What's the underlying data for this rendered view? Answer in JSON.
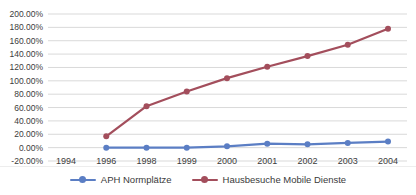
{
  "chart_data": {
    "type": "line",
    "categories": [
      "1994",
      "1996",
      "1998",
      "1999",
      "2000",
      "2001",
      "2002",
      "2003",
      "2004"
    ],
    "series": [
      {
        "name": "APH Normplätze",
        "color": "#5b7ec4",
        "values": [
          null,
          0,
          0,
          0,
          2,
          6,
          5,
          7,
          9
        ]
      },
      {
        "name": "Hausbesuche Mobile Dienste",
        "color": "#a34e5c",
        "values": [
          null,
          17,
          62,
          84,
          104,
          121,
          137,
          154,
          178
        ]
      }
    ],
    "ylim": [
      -20,
      200
    ],
    "y_tick_step": 20,
    "y_tick_labels": [
      "200.00%",
      "180.00%",
      "160.00%",
      "140.00%",
      "120.00%",
      "100.00%",
      "80.00%",
      "60.00%",
      "40.00%",
      "20.00%",
      "0.00%",
      "-20.00%"
    ],
    "grid": "horizontal",
    "legend_position": "bottom",
    "axis_label_color": "#3c3c3c",
    "gridline_color": "#d9d9d9"
  }
}
